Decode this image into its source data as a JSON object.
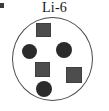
{
  "figure": {
    "label": "Li-6",
    "width_px": 109,
    "height_px": 111,
    "background_color": "#ffffff"
  },
  "corner_mark": {
    "name": "corner-tick-mark",
    "color": "#3a3a3a",
    "x": 0,
    "y": 3,
    "width": 4,
    "height": 5
  },
  "nucleus": {
    "shape": "circle",
    "outline_color": "#4a4a4a",
    "fill_color": "#ffffff",
    "x": 12,
    "y": 17,
    "width": 81,
    "height": 84
  },
  "legend_semantics": {
    "square_means": "proton",
    "circle_means": "neutron",
    "proton_count": 3,
    "neutron_count": 3,
    "mass_number": 6,
    "element_symbol": "Li"
  },
  "particles": [
    {
      "id": "proton-top",
      "type": "proton",
      "shape": "square",
      "color": "#4d4d4d",
      "x": 36,
      "y": 23,
      "width": 15,
      "height": 14
    },
    {
      "id": "neutron-left",
      "type": "neutron",
      "shape": "circle",
      "color": "#2b2b2b",
      "x": 22,
      "y": 44,
      "width": 15,
      "height": 15
    },
    {
      "id": "neutron-right",
      "type": "neutron",
      "shape": "circle",
      "color": "#2b2b2b",
      "x": 56,
      "y": 42,
      "width": 16,
      "height": 16
    },
    {
      "id": "proton-center",
      "type": "proton",
      "shape": "square",
      "color": "#4d4d4d",
      "x": 35,
      "y": 62,
      "width": 15,
      "height": 15
    },
    {
      "id": "proton-right",
      "type": "proton",
      "shape": "square",
      "color": "#4d4d4d",
      "x": 66,
      "y": 67,
      "width": 16,
      "height": 16
    },
    {
      "id": "neutron-bottom",
      "type": "neutron",
      "shape": "circle",
      "color": "#2b2b2b",
      "x": 36,
      "y": 81,
      "width": 16,
      "height": 16
    }
  ]
}
